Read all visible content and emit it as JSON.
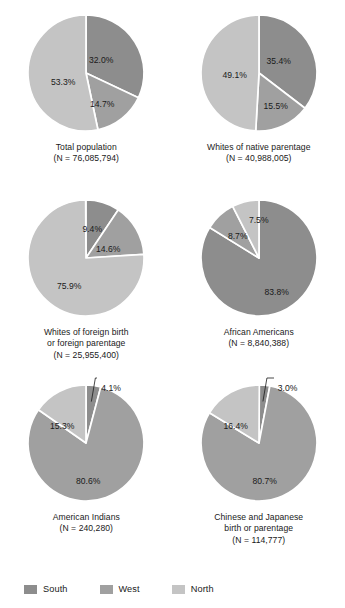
{
  "chart_data": {
    "type": "pie",
    "title": "",
    "legend_position": "bottom-left",
    "categories": [
      "South",
      "West",
      "North"
    ],
    "colors": {
      "South": "#8d8d8d",
      "West": "#a0a0a0",
      "North": "#c4c4c4",
      "divider": "#ffffff",
      "text": "#1a1a1a"
    },
    "charts": [
      {
        "id": "total-population",
        "caption_line1": "Total population",
        "caption_line2": "(N = 76,085,794)",
        "caption_line3": "",
        "n_label": "76,085,794",
        "values": [
          32.0,
          14.7,
          53.3
        ],
        "labels": [
          "32.0%",
          "14.7%",
          "53.3%"
        ],
        "label_positions": [
          {
            "x": 76,
            "y": 48
          },
          {
            "x": 77,
            "y": 92
          },
          {
            "x": 38,
            "y": 70
          }
        ],
        "callout": null
      },
      {
        "id": "whites-native-parentage",
        "caption_line1": "Whites of native parentage",
        "caption_line2": "(N = 40,988,005)",
        "caption_line3": "",
        "n_label": "40,988,005",
        "values": [
          35.4,
          15.5,
          49.1
        ],
        "labels": [
          "35.4%",
          "15.5%",
          "49.1%"
        ],
        "label_positions": [
          {
            "x": 81,
            "y": 49
          },
          {
            "x": 78,
            "y": 94
          },
          {
            "x": 37,
            "y": 63
          }
        ],
        "callout": null
      },
      {
        "id": "whites-foreign-birth-or-parentage",
        "caption_line1": "Whites of foreign birth",
        "caption_line2": "or foreign parentage",
        "caption_line3": "(N = 25,955,400)",
        "n_label": "25,955,400",
        "values": [
          9.4,
          14.6,
          75.9
        ],
        "labels": [
          "9.4%",
          "14.6%",
          "75.9%"
        ],
        "label_positions": [
          {
            "x": 67,
            "y": 32
          },
          {
            "x": 83,
            "y": 52
          },
          {
            "x": 44,
            "y": 89
          }
        ],
        "callout": null
      },
      {
        "id": "african-americans",
        "caption_line1": "African Americans",
        "caption_line2": "(N = 8,840,388)",
        "caption_line3": "",
        "n_label": "8,840,388",
        "values": [
          83.8,
          8.7,
          7.5
        ],
        "labels": [
          "83.8%",
          "8.7%",
          "7.5%"
        ],
        "label_positions": [
          {
            "x": 79,
            "y": 95
          },
          {
            "x": 40,
            "y": 39
          },
          {
            "x": 61,
            "y": 23
          }
        ],
        "callout": null
      },
      {
        "id": "american-indians",
        "caption_line1": "American Indians",
        "caption_line2": "(N = 240,280)",
        "caption_line3": "",
        "n_label": "240,280",
        "values": [
          4.1,
          80.6,
          15.3
        ],
        "labels": [
          "4.1%",
          "80.6%",
          "15.3%"
        ],
        "label_positions": [
          {
            "x": 0,
            "y": 0
          },
          {
            "x": 63,
            "y": 99
          },
          {
            "x": 37,
            "y": 44
          }
        ],
        "callout": {
          "text": "4.1%",
          "x": 76,
          "y": 2
        }
      },
      {
        "id": "chinese-japanese-birth-or-parentage",
        "caption_line1": "Chinese and Japanese",
        "caption_line2": "birth or parentage",
        "caption_line3": "(N = 114,777)",
        "n_label": "114,777",
        "values": [
          3.0,
          80.7,
          16.4
        ],
        "labels": [
          "3.0%",
          "80.7%",
          "16.4%"
        ],
        "label_positions": [
          {
            "x": 0,
            "y": 0
          },
          {
            "x": 67,
            "y": 99
          },
          {
            "x": 38,
            "y": 44
          }
        ],
        "callout": {
          "text": "3.0%",
          "x": 80,
          "y": 2
        }
      }
    ],
    "legend": [
      {
        "label": "South",
        "color": "#8d8d8d"
      },
      {
        "label": "West",
        "color": "#a0a0a0"
      },
      {
        "label": "North",
        "color": "#c4c4c4"
      }
    ]
  }
}
